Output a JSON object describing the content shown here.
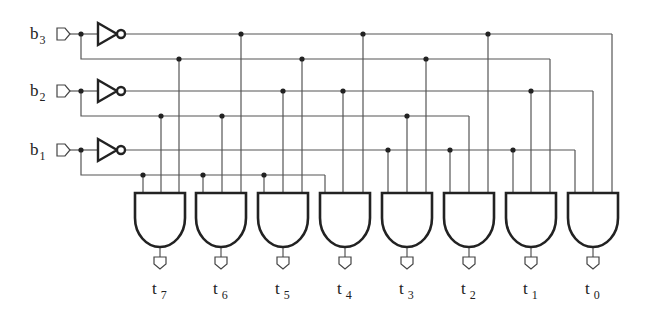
{
  "diagram": {
    "colors": {
      "wire": "#555555",
      "gate": "#222222",
      "background": "#ffffff"
    },
    "inputs": [
      {
        "name": "b",
        "sub": "3",
        "y": 34,
        "true_y": 59,
        "comp_y": 34,
        "true_line_y": 59
      },
      {
        "name": "b",
        "sub": "2",
        "y": 91,
        "true_y": 116,
        "comp_y": 91,
        "true_line_y": 116
      },
      {
        "name": "b",
        "sub": "1",
        "y": 150,
        "true_y": 175,
        "comp_y": 150,
        "true_line_y": 175
      }
    ],
    "gates": [
      {
        "output": "t",
        "sub": "7",
        "x": 135,
        "inputs": [
          {
            "x": 143,
            "line": "b1"
          },
          {
            "x": 161,
            "line": "b2"
          },
          {
            "x": 179,
            "line": "b3"
          }
        ]
      },
      {
        "output": "t",
        "sub": "6",
        "x": 196,
        "inputs": [
          {
            "x": 203,
            "line": "b1"
          },
          {
            "x": 222,
            "line": "b2"
          },
          {
            "x": 241,
            "line": "b3n"
          }
        ]
      },
      {
        "output": "t",
        "sub": "5",
        "x": 258,
        "inputs": [
          {
            "x": 264,
            "line": "b1"
          },
          {
            "x": 283,
            "line": "b2n"
          },
          {
            "x": 302,
            "line": "b3"
          }
        ]
      },
      {
        "output": "t",
        "sub": "4",
        "x": 320,
        "inputs": [
          {
            "x": 325,
            "line": "b1"
          },
          {
            "x": 343,
            "line": "b2n"
          },
          {
            "x": 363,
            "line": "b3n"
          }
        ]
      },
      {
        "output": "t",
        "sub": "3",
        "x": 382,
        "inputs": [
          {
            "x": 388,
            "line": "b1n"
          },
          {
            "x": 407,
            "line": "b2"
          },
          {
            "x": 426,
            "line": "b3"
          }
        ]
      },
      {
        "output": "t",
        "sub": "2",
        "x": 444,
        "inputs": [
          {
            "x": 450,
            "line": "b1n"
          },
          {
            "x": 469,
            "line": "b2"
          },
          {
            "x": 488,
            "line": "b3n"
          }
        ]
      },
      {
        "output": "t",
        "sub": "1",
        "x": 506,
        "inputs": [
          {
            "x": 513,
            "line": "b1n"
          },
          {
            "x": 531,
            "line": "b2n"
          },
          {
            "x": 550,
            "line": "b3"
          }
        ]
      },
      {
        "output": "t",
        "sub": "0",
        "x": 568,
        "inputs": [
          {
            "x": 575,
            "line": "b1n"
          },
          {
            "x": 593,
            "line": "b2n"
          },
          {
            "x": 612,
            "line": "b3n"
          }
        ]
      }
    ],
    "lines": {
      "b3n": 34,
      "b3": 59,
      "b2n": 91,
      "b2": 116,
      "b1n": 150,
      "b1": 175
    }
  }
}
